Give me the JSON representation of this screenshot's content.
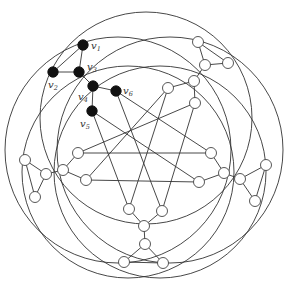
{
  "diagram": {
    "type": "graph",
    "colors": {
      "edge": "#333333",
      "filled_node": "#111111",
      "open_node": "#ffffff"
    },
    "circles": [
      {
        "cx": 146,
        "cy": 118,
        "r": 106
      },
      {
        "cx": 170,
        "cy": 150,
        "r": 113
      },
      {
        "cx": 160,
        "cy": 172,
        "r": 106
      },
      {
        "cx": 128,
        "cy": 172,
        "r": 106
      },
      {
        "cx": 118,
        "cy": 150,
        "r": 113
      }
    ],
    "nodes": [
      {
        "id": "v1",
        "x": 83,
        "y": 45,
        "filled": true,
        "label": "v",
        "sub": "1",
        "lx": 91,
        "ly": 49
      },
      {
        "id": "v2",
        "x": 53,
        "y": 72,
        "filled": true,
        "label": "v",
        "sub": "2",
        "lx": 48,
        "ly": 88
      },
      {
        "id": "v3",
        "x": 79,
        "y": 72,
        "filled": true,
        "label": "v",
        "sub": "3",
        "lx": 87,
        "ly": 70
      },
      {
        "id": "v4",
        "x": 93,
        "y": 86,
        "filled": true,
        "label": "v",
        "sub": "4",
        "lx": 78,
        "ly": 100
      },
      {
        "id": "v5",
        "x": 92,
        "y": 111,
        "filled": true,
        "label": "v",
        "sub": "5",
        "lx": 80,
        "ly": 127
      },
      {
        "id": "v6",
        "x": 116,
        "y": 91,
        "filled": true,
        "label": "v",
        "sub": "6",
        "lx": 123,
        "ly": 94
      },
      {
        "id": "t1",
        "x": 198,
        "y": 42,
        "filled": false
      },
      {
        "id": "t2",
        "x": 228,
        "y": 63,
        "filled": false
      },
      {
        "id": "t3",
        "x": 205,
        "y": 65,
        "filled": false
      },
      {
        "id": "t4",
        "x": 194,
        "y": 81,
        "filled": false
      },
      {
        "id": "t5",
        "x": 168,
        "y": 88,
        "filled": false
      },
      {
        "id": "t6",
        "x": 195,
        "y": 103,
        "filled": false
      },
      {
        "id": "r1",
        "x": 266,
        "y": 165,
        "filled": false
      },
      {
        "id": "r2",
        "x": 255,
        "y": 201,
        "filled": false
      },
      {
        "id": "r3",
        "x": 240,
        "y": 179,
        "filled": false
      },
      {
        "id": "r4",
        "x": 224,
        "y": 173,
        "filled": false
      },
      {
        "id": "r5",
        "x": 211,
        "y": 153,
        "filled": false
      },
      {
        "id": "r6",
        "x": 199,
        "y": 182,
        "filled": false
      },
      {
        "id": "b1",
        "x": 124,
        "y": 262,
        "filled": false
      },
      {
        "id": "b2",
        "x": 163,
        "y": 263,
        "filled": false
      },
      {
        "id": "b3",
        "x": 145,
        "y": 244,
        "filled": false
      },
      {
        "id": "b4",
        "x": 144,
        "y": 226,
        "filled": false
      },
      {
        "id": "b5",
        "x": 129,
        "y": 209,
        "filled": false
      },
      {
        "id": "b6",
        "x": 162,
        "y": 211,
        "filled": false
      },
      {
        "id": "l1",
        "x": 25,
        "y": 160,
        "filled": false
      },
      {
        "id": "l2",
        "x": 35,
        "y": 197,
        "filled": false
      },
      {
        "id": "l3",
        "x": 46,
        "y": 174,
        "filled": false
      },
      {
        "id": "l4",
        "x": 63,
        "y": 170,
        "filled": false
      },
      {
        "id": "l5",
        "x": 78,
        "y": 153,
        "filled": false
      },
      {
        "id": "l6",
        "x": 86,
        "y": 180,
        "filled": false
      }
    ],
    "edges": [
      [
        "v1",
        "v2"
      ],
      [
        "v1",
        "v3"
      ],
      [
        "v2",
        "v3"
      ],
      [
        "v3",
        "v4"
      ],
      [
        "v4",
        "v5"
      ],
      [
        "v4",
        "v6"
      ],
      [
        "t1",
        "t2"
      ],
      [
        "t1",
        "t3"
      ],
      [
        "t2",
        "t3"
      ],
      [
        "t3",
        "t4"
      ],
      [
        "t4",
        "t5"
      ],
      [
        "t4",
        "t6"
      ],
      [
        "r1",
        "r2"
      ],
      [
        "r1",
        "r3"
      ],
      [
        "r2",
        "r3"
      ],
      [
        "r3",
        "r4"
      ],
      [
        "r4",
        "r5"
      ],
      [
        "r4",
        "r6"
      ],
      [
        "b1",
        "b2"
      ],
      [
        "b1",
        "b3"
      ],
      [
        "b2",
        "b3"
      ],
      [
        "b3",
        "b4"
      ],
      [
        "b4",
        "b5"
      ],
      [
        "b4",
        "b6"
      ],
      [
        "l1",
        "l2"
      ],
      [
        "l1",
        "l3"
      ],
      [
        "l2",
        "l3"
      ],
      [
        "l3",
        "l4"
      ],
      [
        "l4",
        "l5"
      ],
      [
        "l4",
        "l6"
      ],
      [
        "v5",
        "b5"
      ],
      [
        "v5",
        "r6"
      ],
      [
        "v6",
        "b6"
      ],
      [
        "v6",
        "r5"
      ],
      [
        "t5",
        "l6"
      ],
      [
        "t5",
        "b5"
      ],
      [
        "t6",
        "l5"
      ],
      [
        "t6",
        "b6"
      ],
      [
        "l5",
        "r5"
      ],
      [
        "l6",
        "r6"
      ]
    ]
  }
}
